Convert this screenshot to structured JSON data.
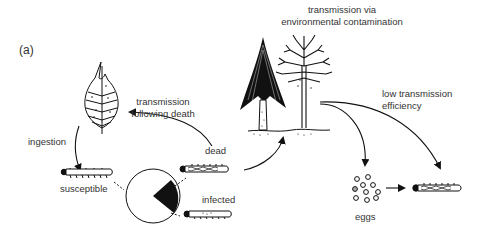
{
  "panel_label": "(a)",
  "labels": {
    "env_line1": "transmission via",
    "env_line2": "environmental contamination",
    "death_line1": "transmission",
    "death_line2": "following death",
    "ingestion": "ingestion",
    "dead": "dead",
    "susceptible": "susceptible",
    "infected": "infected",
    "low_line1": "low transmission",
    "low_line2": "efficiency",
    "eggs": "eggs"
  },
  "colors": {
    "ink": "#111111",
    "text": "#333333",
    "background": "#ffffff"
  }
}
